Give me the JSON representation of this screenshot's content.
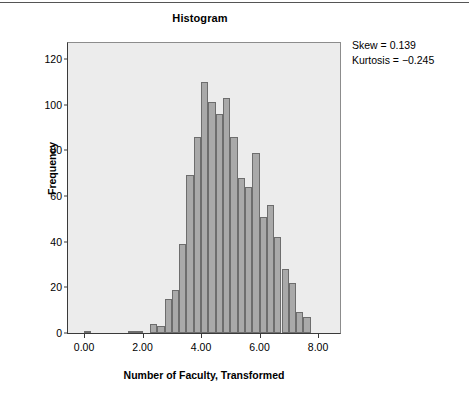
{
  "figure": {
    "title": "Histogram",
    "annotations": [
      "Skew = 0.139",
      "Kurtosis = −0.245"
    ]
  },
  "chart_data": {
    "type": "bar",
    "subtype": "histogram",
    "title": "Histogram",
    "xlabel": "Number of Faculty, Transformed",
    "ylabel": "Frequency",
    "xlim": [
      -0.55,
      8.75
    ],
    "ylim": [
      0,
      127
    ],
    "xticks": [
      "0.00",
      "2.00",
      "4.00",
      "6.00",
      "8.00"
    ],
    "xtick_values": [
      0,
      2,
      4,
      6,
      8
    ],
    "yticks": [
      "0",
      "20",
      "40",
      "60",
      "80",
      "100",
      "120"
    ],
    "ytick_values": [
      0,
      20,
      40,
      60,
      80,
      100,
      120
    ],
    "grid": false,
    "legend": false,
    "bin_width": 0.25,
    "bar_color": "#a9a9a9",
    "bar_edge_color": "#6d6d6d",
    "panel_color": "#ececec",
    "bins": [
      {
        "center": 0.125,
        "value": 1
      },
      {
        "center": 1.625,
        "value": 1
      },
      {
        "center": 1.875,
        "value": 1
      },
      {
        "center": 2.375,
        "value": 4
      },
      {
        "center": 2.625,
        "value": 3
      },
      {
        "center": 2.875,
        "value": 15
      },
      {
        "center": 3.125,
        "value": 19
      },
      {
        "center": 3.375,
        "value": 39
      },
      {
        "center": 3.625,
        "value": 69
      },
      {
        "center": 3.875,
        "value": 86
      },
      {
        "center": 4.125,
        "value": 110
      },
      {
        "center": 4.375,
        "value": 101
      },
      {
        "center": 4.625,
        "value": 96
      },
      {
        "center": 4.875,
        "value": 103
      },
      {
        "center": 5.125,
        "value": 86
      },
      {
        "center": 5.375,
        "value": 68
      },
      {
        "center": 5.625,
        "value": 64
      },
      {
        "center": 5.875,
        "value": 79
      },
      {
        "center": 6.125,
        "value": 51
      },
      {
        "center": 6.375,
        "value": 56
      },
      {
        "center": 6.625,
        "value": 42
      },
      {
        "center": 6.875,
        "value": 28
      },
      {
        "center": 7.125,
        "value": 22
      },
      {
        "center": 7.375,
        "value": 9
      },
      {
        "center": 7.625,
        "value": 7
      }
    ],
    "statistics": {
      "skew": 0.139,
      "kurtosis": -0.245
    }
  }
}
